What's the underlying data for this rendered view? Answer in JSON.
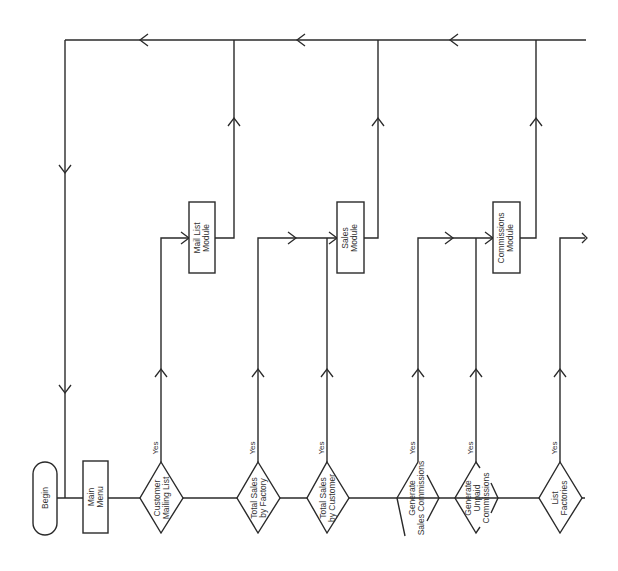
{
  "diagram": {
    "type": "flowchart",
    "orientation": "rotated-90-ccw",
    "colors": {
      "line": "#2a2a2a",
      "text": "#333333",
      "background": "#ffffff"
    },
    "start": {
      "label": [
        "Begin"
      ]
    },
    "main_menu": {
      "label": [
        "Main",
        "Menu"
      ]
    },
    "decisions": [
      {
        "id": "customer-mailing-list",
        "label": [
          "Customer",
          "Mailing List"
        ],
        "branch_label": "Yes",
        "target": "mail-list-module"
      },
      {
        "id": "total-sales-by-factory",
        "label": [
          "Total Sales",
          "by Factory"
        ],
        "branch_label": "Yes",
        "target": "sales-module"
      },
      {
        "id": "total-sales-by-customer",
        "label": [
          "Total Sales",
          "by Customer"
        ],
        "branch_label": "Yes",
        "target": "sales-module"
      },
      {
        "id": "generate-sales-commissions",
        "label": [
          "Generate",
          "Sales Commissions"
        ],
        "branch_label": "Yes",
        "target": "commissions-module"
      },
      {
        "id": "generate-unpaid-commissions",
        "label": [
          "Generate",
          "Unpaid",
          "Commissions"
        ],
        "branch_label": "Yes",
        "target": "commissions-module"
      },
      {
        "id": "list-factories",
        "label": [
          "List",
          "Factories"
        ],
        "branch_label": "Yes",
        "target": "(continues off page)"
      }
    ],
    "modules": [
      {
        "id": "mail-list-module",
        "label": [
          "Mail List",
          "Module"
        ]
      },
      {
        "id": "sales-module",
        "label": [
          "Sales",
          "Module"
        ]
      },
      {
        "id": "commissions-module",
        "label": [
          "Commissions",
          "Module"
        ]
      }
    ]
  }
}
